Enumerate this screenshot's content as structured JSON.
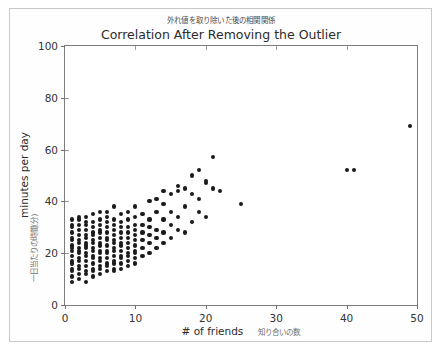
{
  "figure": {
    "background": "#ffffff",
    "border_color": "#c9c9c9",
    "axis_color": "#7d7d7d",
    "point_color": "#1b1b1b"
  },
  "chart_data": {
    "type": "scatter",
    "title": "Correlation After Removing the Outlier",
    "subtitle": "外れ値を取り除いた後の相関関係",
    "xlabel": "# of friends",
    "xlabel_jp": "知り合いの数",
    "ylabel": "minutes per day",
    "ylabel_jp": "一日当たりの時間(分)",
    "xlim": [
      0,
      50
    ],
    "ylim": [
      0,
      100
    ],
    "xticks": [
      0,
      10,
      20,
      30,
      40,
      50
    ],
    "yticks": [
      0,
      20,
      40,
      60,
      80,
      100
    ],
    "grid": false,
    "legend": null,
    "marker": "circle",
    "marker_color": "#1b1b1b",
    "points": [
      [
        1,
        9
      ],
      [
        1,
        11
      ],
      [
        1,
        13
      ],
      [
        1,
        14
      ],
      [
        1,
        16
      ],
      [
        1,
        17
      ],
      [
        1,
        19
      ],
      [
        1,
        21
      ],
      [
        1,
        22
      ],
      [
        1,
        23
      ],
      [
        1,
        25
      ],
      [
        1,
        26
      ],
      [
        1,
        28
      ],
      [
        1,
        30
      ],
      [
        1,
        31
      ],
      [
        1,
        33
      ],
      [
        2,
        10
      ],
      [
        2,
        12
      ],
      [
        2,
        14
      ],
      [
        2,
        15
      ],
      [
        2,
        17
      ],
      [
        2,
        18
      ],
      [
        2,
        20
      ],
      [
        2,
        21
      ],
      [
        2,
        22
      ],
      [
        2,
        24
      ],
      [
        2,
        25
      ],
      [
        2,
        27
      ],
      [
        2,
        29
      ],
      [
        2,
        31
      ],
      [
        2,
        33
      ],
      [
        2,
        34
      ],
      [
        3,
        9
      ],
      [
        3,
        12
      ],
      [
        3,
        13
      ],
      [
        3,
        15
      ],
      [
        3,
        17
      ],
      [
        3,
        19
      ],
      [
        3,
        20
      ],
      [
        3,
        22
      ],
      [
        3,
        23
      ],
      [
        3,
        24
      ],
      [
        3,
        26
      ],
      [
        3,
        27
      ],
      [
        3,
        29
      ],
      [
        3,
        31
      ],
      [
        3,
        32
      ],
      [
        3,
        34
      ],
      [
        4,
        11
      ],
      [
        4,
        13
      ],
      [
        4,
        14
      ],
      [
        4,
        16
      ],
      [
        4,
        18
      ],
      [
        4,
        19
      ],
      [
        4,
        21
      ],
      [
        4,
        22
      ],
      [
        4,
        24
      ],
      [
        4,
        25
      ],
      [
        4,
        27
      ],
      [
        4,
        28
      ],
      [
        4,
        30
      ],
      [
        4,
        32
      ],
      [
        4,
        35
      ],
      [
        5,
        12
      ],
      [
        5,
        14
      ],
      [
        5,
        15
      ],
      [
        5,
        17
      ],
      [
        5,
        18
      ],
      [
        5,
        20
      ],
      [
        5,
        21
      ],
      [
        5,
        23
      ],
      [
        5,
        24
      ],
      [
        5,
        26
      ],
      [
        5,
        28
      ],
      [
        5,
        29
      ],
      [
        5,
        31
      ],
      [
        5,
        33
      ],
      [
        5,
        36
      ],
      [
        6,
        13
      ],
      [
        6,
        15
      ],
      [
        6,
        16
      ],
      [
        6,
        18
      ],
      [
        6,
        20
      ],
      [
        6,
        21
      ],
      [
        6,
        23
      ],
      [
        6,
        25
      ],
      [
        6,
        26
      ],
      [
        6,
        28
      ],
      [
        6,
        30
      ],
      [
        6,
        32
      ],
      [
        6,
        34
      ],
      [
        6,
        36
      ],
      [
        7,
        13
      ],
      [
        7,
        14
      ],
      [
        7,
        16
      ],
      [
        7,
        17
      ],
      [
        7,
        19
      ],
      [
        7,
        21
      ],
      [
        7,
        22
      ],
      [
        7,
        24
      ],
      [
        7,
        25
      ],
      [
        7,
        27
      ],
      [
        7,
        29
      ],
      [
        7,
        31
      ],
      [
        7,
        33
      ],
      [
        7,
        38
      ],
      [
        8,
        14
      ],
      [
        8,
        16
      ],
      [
        8,
        18
      ],
      [
        8,
        19
      ],
      [
        8,
        21
      ],
      [
        8,
        23
      ],
      [
        8,
        24
      ],
      [
        8,
        26
      ],
      [
        8,
        28
      ],
      [
        8,
        30
      ],
      [
        8,
        32
      ],
      [
        8,
        35
      ],
      [
        9,
        15
      ],
      [
        9,
        17
      ],
      [
        9,
        19
      ],
      [
        9,
        20
      ],
      [
        9,
        22
      ],
      [
        9,
        24
      ],
      [
        9,
        26
      ],
      [
        9,
        28
      ],
      [
        9,
        30
      ],
      [
        9,
        33
      ],
      [
        9,
        36
      ],
      [
        10,
        16
      ],
      [
        10,
        18
      ],
      [
        10,
        20
      ],
      [
        10,
        21
      ],
      [
        10,
        23
      ],
      [
        10,
        25
      ],
      [
        10,
        27
      ],
      [
        10,
        29
      ],
      [
        10,
        31
      ],
      [
        10,
        34
      ],
      [
        10,
        38
      ],
      [
        11,
        19
      ],
      [
        11,
        22
      ],
      [
        11,
        25
      ],
      [
        11,
        28
      ],
      [
        11,
        31
      ],
      [
        11,
        35
      ],
      [
        12,
        20
      ],
      [
        12,
        24
      ],
      [
        12,
        27
      ],
      [
        12,
        30
      ],
      [
        12,
        33
      ],
      [
        12,
        40
      ],
      [
        13,
        22
      ],
      [
        13,
        26
      ],
      [
        13,
        29
      ],
      [
        13,
        36
      ],
      [
        13,
        41
      ],
      [
        14,
        24
      ],
      [
        14,
        28
      ],
      [
        14,
        33
      ],
      [
        14,
        39
      ],
      [
        14,
        44
      ],
      [
        15,
        26
      ],
      [
        15,
        31
      ],
      [
        15,
        36
      ],
      [
        15,
        43
      ],
      [
        16,
        29
      ],
      [
        16,
        34
      ],
      [
        16,
        44
      ],
      [
        16,
        46
      ],
      [
        17,
        28
      ],
      [
        17,
        38
      ],
      [
        17,
        45
      ],
      [
        18,
        32
      ],
      [
        18,
        43
      ],
      [
        18,
        50
      ],
      [
        19,
        36
      ],
      [
        19,
        41
      ],
      [
        19,
        52
      ],
      [
        20,
        34
      ],
      [
        20,
        47
      ],
      [
        20,
        48
      ],
      [
        21,
        45
      ],
      [
        21,
        57
      ],
      [
        22,
        44
      ],
      [
        25,
        39
      ],
      [
        40,
        52
      ],
      [
        41,
        52
      ],
      [
        49,
        69
      ]
    ]
  }
}
